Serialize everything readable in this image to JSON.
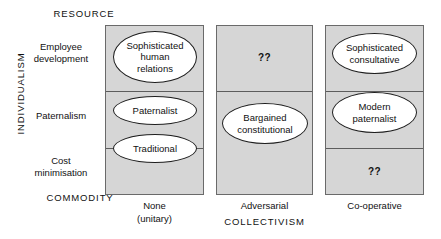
{
  "figure": {
    "title_top_left": "RESOURCE",
    "title_bottom_left": "COMMODITY",
    "y_axis_title": "INDIVIDUALISM",
    "x_axis_title": "COLLECTIVISM"
  },
  "rows": [
    {
      "id": "employee-development",
      "label_line1": "Employee",
      "label_line2": "development"
    },
    {
      "id": "paternalism",
      "label_line1": "Paternalism",
      "label_line2": ""
    },
    {
      "id": "cost-minimisation",
      "label_line1": "Cost",
      "label_line2": "minimisation"
    }
  ],
  "columns": [
    {
      "id": "none-unitary",
      "label_line1": "None",
      "label_line2": "(unitary)"
    },
    {
      "id": "adversarial",
      "label_line1": "Adversarial",
      "label_line2": ""
    },
    {
      "id": "co-operative",
      "label_line1": "Co-operative",
      "label_line2": ""
    }
  ],
  "cells": {
    "col1_row1_oval": "Sophisticated\nhuman\nrelations",
    "col1_row1_oval_l1": "Sophisticated",
    "col1_row1_oval_l2": "human",
    "col1_row1_oval_l3": "relations",
    "col1_row2_oval": "Paternalist",
    "col1_row3_oval": "Traditional",
    "col2_row1_text": "??",
    "col2_oval_l1": "Bargained",
    "col2_oval_l2": "constitutional",
    "col3_row1_oval_l1": "Sophisticated",
    "col3_row1_oval_l2": "consultative",
    "col3_row2_oval_l1": "Modern",
    "col3_row2_oval_l2": "paternalist",
    "col3_row3_text": "??"
  },
  "colors": {
    "cell_fill": "#d6d6d6",
    "cell_border": "#6a6a6a",
    "oval_fill": "#ffffff",
    "oval_border": "#1e1e1e",
    "text": "#111111",
    "background": "#ffffff"
  }
}
